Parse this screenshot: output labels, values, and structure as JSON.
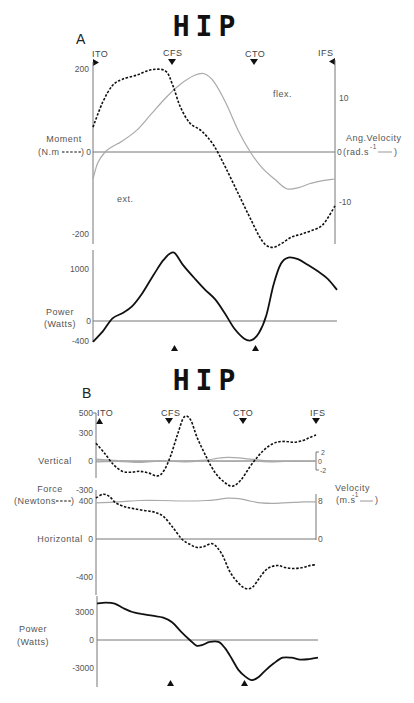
{
  "chart_data": [
    {
      "panel": "A",
      "title": "HIP",
      "type": "line",
      "events": [
        "ITO",
        "CFS",
        "CTO",
        "IFS"
      ],
      "event_positions_pct_cycle": [
        0,
        33,
        67,
        100
      ],
      "subplots": [
        {
          "name": "moment-angular-velocity",
          "left_axis": {
            "label_line1": "Moment",
            "label_line2": "(N.m",
            "legend_style": "dashed",
            "ticks": [
              200,
              0,
              -200
            ],
            "ylim": [
              -230,
              230
            ]
          },
          "right_axis": {
            "label_line1": "Ang.Velocity",
            "label_line2": "(rad.s",
            "superscript": "-1",
            "legend_style": "solid-gray",
            "ticks": [
              10,
              0,
              -10
            ],
            "ylim": [
              -15,
              15
            ]
          },
          "annotations": [
            "flex.",
            "ext."
          ],
          "series": [
            {
              "name": "Moment",
              "axis": "left",
              "style": "dashed",
              "x": [
                0,
                4,
                8,
                12,
                18,
                24,
                30,
                33,
                36,
                40,
                45,
                50,
                55,
                60,
                65,
                70,
                74,
                78,
                82,
                86,
                90,
                95,
                100
              ],
              "y": [
                60,
                120,
                160,
                175,
                185,
                198,
                195,
                160,
                110,
                70,
                50,
                15,
                -40,
                -100,
                -160,
                -215,
                -230,
                -220,
                -205,
                -198,
                -190,
                -175,
                -130
              ]
            },
            {
              "name": "Ang.Velocity",
              "axis": "right",
              "style": "solid-gray",
              "x": [
                0,
                2,
                5,
                8,
                12,
                18,
                24,
                30,
                36,
                42,
                46,
                50,
                55,
                60,
                65,
                70,
                75,
                80,
                85,
                90,
                95,
                100
              ],
              "y": [
                -5,
                -2,
                0,
                1,
                2,
                4,
                7,
                10,
                12.5,
                14.2,
                14.5,
                13,
                9,
                4,
                0,
                -3,
                -5,
                -6.8,
                -6.6,
                -5.8,
                -5.3,
                -5
              ]
            }
          ]
        },
        {
          "name": "power",
          "left_axis": {
            "label_line1": "Power",
            "label_line2": "(Watts)",
            "ticks": [
              1000,
              0,
              -400
            ],
            "ylim": [
              -400,
              1400
            ]
          },
          "markers": [
            33,
            67
          ],
          "series": [
            {
              "name": "Power",
              "style": "solid",
              "x": [
                0,
                4,
                8,
                12,
                16,
                20,
                25,
                29,
                33,
                37,
                42,
                46,
                50,
                54,
                58,
                62,
                65,
                68,
                71,
                74,
                77,
                80,
                84,
                88,
                92,
                96,
                100
              ],
              "y": [
                -400,
                -200,
                50,
                150,
                280,
                520,
                900,
                1180,
                1320,
                1070,
                800,
                600,
                420,
                150,
                -150,
                -340,
                -370,
                -230,
                100,
                700,
                1100,
                1220,
                1190,
                1080,
                960,
                820,
                600
              ]
            }
          ]
        }
      ]
    },
    {
      "panel": "B",
      "title": "HIP",
      "type": "line",
      "events": [
        "ITO",
        "CFS",
        "CTO",
        "IFS"
      ],
      "event_positions_pct_cycle": [
        0,
        33,
        67,
        100
      ],
      "subplots": [
        {
          "name": "vertical",
          "row_label": "Vertical",
          "left_axis": {
            "ticks": [
              500,
              300,
              0,
              -300
            ],
            "ylim": [
              -300,
              500
            ]
          },
          "right_axis": {
            "ticks": [
              2,
              0,
              -2
            ],
            "ylim": [
              -2,
              2
            ]
          },
          "series": [
            {
              "name": "Vertical Force",
              "axis": "left",
              "style": "dashed",
              "x": [
                0,
                4,
                8,
                12,
                16,
                20,
                24,
                28,
                31,
                34,
                37,
                40,
                43,
                46,
                50,
                54,
                58,
                62,
                66,
                70,
                74,
                78,
                82,
                86,
                90,
                94,
                97,
                100
              ],
              "y": [
                190,
                80,
                -40,
                -110,
                -120,
                -110,
                -130,
                -160,
                -100,
                60,
                280,
                470,
                440,
                250,
                50,
                -120,
                -220,
                -270,
                -200,
                -60,
                60,
                150,
                200,
                210,
                200,
                220,
                250,
                280
              ]
            },
            {
              "name": "Vertical Velocity",
              "axis": "right",
              "style": "solid-gray",
              "x": [
                0,
                10,
                20,
                30,
                40,
                50,
                55,
                60,
                65,
                70,
                80,
                90,
                100
              ],
              "y": [
                0.4,
                0.1,
                -0.1,
                0,
                0,
                0.2,
                0.6,
                0.8,
                0.7,
                0.4,
                0,
                -0.1,
                0
              ]
            },
            {
              "name": "Vertical Velocity (2)",
              "axis": "right",
              "style": "solid-gray",
              "x": [
                0,
                10,
                20,
                30,
                40,
                50,
                60,
                70,
                80,
                90,
                100
              ],
              "y": [
                -0.2,
                -0.1,
                -0.3,
                0,
                -0.2,
                0,
                -0.1,
                0,
                -0.2,
                0,
                -0.1
              ]
            }
          ]
        },
        {
          "name": "horizontal",
          "row_label": "Horizontal",
          "force_label_line1": "Force",
          "force_label_line2": "(Newtons",
          "velocity_label_line1": "Velocity",
          "velocity_label_line2": "(m.s",
          "velocity_superscript": "-1",
          "left_axis": {
            "ticks": [
              400,
              0,
              -400
            ],
            "ylim": [
              -540,
              480
            ]
          },
          "right_axis": {
            "ticks": [
              8,
              0
            ],
            "ylim": [
              0,
              10
            ]
          },
          "series": [
            {
              "name": "Horizontal Force",
              "axis": "left",
              "style": "dashed",
              "x": [
                0,
                3,
                6,
                9,
                13,
                17,
                22,
                27,
                31,
                35,
                39,
                43,
                46,
                49,
                53,
                57,
                61,
                65,
                68,
                71,
                74,
                77,
                80,
                83,
                86,
                90,
                94,
                97,
                100
              ],
              "y": [
                430,
                470,
                450,
                380,
                340,
                320,
                300,
                280,
                230,
                120,
                0,
                -60,
                -90,
                -80,
                -50,
                -150,
                -350,
                -470,
                -520,
                -510,
                -420,
                -330,
                -290,
                -280,
                -300,
                -310,
                -300,
                -280,
                -270
              ]
            },
            {
              "name": "Horizontal Velocity",
              "axis": "right",
              "style": "solid-gray",
              "x": [
                0,
                10,
                20,
                30,
                40,
                50,
                55,
                60,
                65,
                70,
                75,
                80,
                85,
                90,
                95,
                100
              ],
              "y": [
                7.6,
                7.8,
                8.1,
                8.1,
                8.0,
                8.1,
                8.3,
                8.6,
                8.5,
                8.0,
                7.6,
                7.5,
                7.6,
                7.7,
                7.8,
                7.8
              ]
            }
          ]
        },
        {
          "name": "power",
          "left_axis": {
            "label_line1": "Power",
            "label_line2": "(Watts)",
            "ticks": [
              3000,
              0,
              -3000
            ],
            "ylim": [
              -4200,
              4000
            ]
          },
          "markers": [
            33,
            67
          ],
          "series": [
            {
              "name": "Power",
              "style": "solid",
              "x": [
                0,
                4,
                8,
                12,
                16,
                20,
                25,
                30,
                34,
                38,
                42,
                45,
                48,
                51,
                55,
                58,
                61,
                64,
                67,
                70,
                73,
                76,
                80,
                84,
                88,
                92,
                96,
                100
              ],
              "y": [
                3900,
                4000,
                3900,
                3400,
                3000,
                2800,
                2600,
                2400,
                1900,
                900,
                0,
                -600,
                -500,
                -200,
                -200,
                -900,
                -2000,
                -3200,
                -3900,
                -4300,
                -4000,
                -3300,
                -2500,
                -1900,
                -1900,
                -2100,
                -2050,
                -1900
              ]
            }
          ]
        }
      ]
    }
  ],
  "labels": {
    "title_a": "HIP",
    "title_b": "HIP",
    "panel_a": "A",
    "panel_b": "B",
    "flex": "flex.",
    "ext": "ext.",
    "moment_l1": "Moment",
    "moment_l2": "(N.m",
    "angvel_l1": "Ang.Velocity",
    "angvel_l2": "(rad.s",
    "angvel_sup": "-1",
    "power_l1": "Power",
    "power_l2": "(Watts)",
    "vertical": "Vertical",
    "horizontal": "Horizontal",
    "force_l1": "Force",
    "force_l2": "(Newtons",
    "vel_l1": "Velocity",
    "vel_l2": "(m.s",
    "vel_sup": "-1",
    "close_paren": ")",
    "ev_ito": "ITO",
    "ev_cfs": "CFS",
    "ev_cto": "CTO",
    "ev_ifs": "IFS",
    "a_mom_200": "200",
    "a_mom_0": "0",
    "a_mom_m200": "-200",
    "a_vel_10": "10",
    "a_vel_0": "0",
    "a_vel_m10": "-10",
    "a_pow_1000": "1000",
    "a_pow_0": "0",
    "a_pow_m400": "-400",
    "b_v_500": "500",
    "b_v_300": "300",
    "b_v_0": "0",
    "b_v_m300": "-300",
    "b_vv_2": "2",
    "b_vv_0": "0",
    "b_vv_m2": "-2",
    "b_h_400": "400",
    "b_h_0": "0",
    "b_h_m400": "-400",
    "b_hv_8": "8",
    "b_hv_0": "0",
    "b_p_3000": "3000",
    "b_p_0": "0",
    "b_p_m3000": "-3000"
  }
}
